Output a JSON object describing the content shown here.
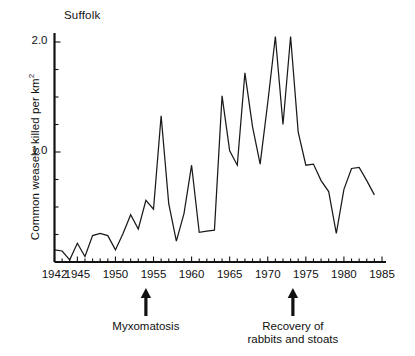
{
  "chart_data": {
    "type": "line",
    "title": "Suffolk",
    "xlabel": "",
    "ylabel": "Common weasels killed per km²",
    "xlim": [
      1942,
      1985
    ],
    "ylim": [
      0,
      2.18
    ],
    "grid": false,
    "legend": null,
    "x_major_ticks": [
      1942,
      1945,
      1950,
      1955,
      1960,
      1965,
      1970,
      1975,
      1980,
      1985
    ],
    "x_major_tick_labels": [
      "1942",
      "1945",
      "1950",
      "1955",
      "1960",
      "1965",
      "1970",
      "1975",
      "1980",
      "1985"
    ],
    "x_minor_tick_interval": 1,
    "y_major_ticks": [
      1.0,
      2.0
    ],
    "y_major_tick_labels": [
      "1.0",
      "2.0"
    ],
    "y_minor_tick_interval": 0.25,
    "series": [
      {
        "name": "Common weasels killed per km2",
        "x": [
          1942,
          1943,
          1944,
          1945,
          1946,
          1947,
          1948,
          1949,
          1950,
          1951,
          1952,
          1953,
          1954,
          1955,
          1956,
          1957,
          1958,
          1959,
          1960,
          1961,
          1962,
          1963,
          1964,
          1965,
          1966,
          1967,
          1968,
          1969,
          1970,
          1971,
          1972,
          1973,
          1974,
          1975,
          1976,
          1977,
          1978,
          1979,
          1980,
          1981,
          1982,
          1983,
          1984
        ],
        "values": [
          0.11,
          0.1,
          0.02,
          0.17,
          0.05,
          0.24,
          0.26,
          0.24,
          0.11,
          0.26,
          0.43,
          0.3,
          0.56,
          0.48,
          1.33,
          0.53,
          0.19,
          0.44,
          0.88,
          0.27,
          0.28,
          0.29,
          1.51,
          1.01,
          0.88,
          1.72,
          1.23,
          0.89,
          1.45,
          2.05,
          1.25,
          2.05,
          1.18,
          0.88,
          0.89,
          0.74,
          0.64,
          0.26,
          0.66,
          0.85,
          0.86,
          0.74,
          0.61
        ]
      }
    ],
    "annotations": [
      {
        "id": "myxomatosis",
        "label": "Myxomatosis",
        "x": 1954,
        "marker": "up-arrow",
        "position": "below-axis"
      },
      {
        "id": "recovery",
        "label": "Recovery of\nrabbits and stoats",
        "line1": "Recovery of",
        "line2": "rabbits and stoats",
        "x": 1973.3,
        "marker": "up-arrow",
        "position": "below-axis"
      }
    ]
  },
  "figure": {
    "background_color": "#ffffff",
    "line_color": "#1a1a1a",
    "axis_color": "#111111"
  },
  "axis": {
    "y_labels": [
      {
        "text": "2.0",
        "value": 2.0
      },
      {
        "text": "1.0",
        "value": 1.0
      }
    ],
    "x_labels": [
      {
        "text": "1942",
        "value": 1942
      },
      {
        "text": "1945",
        "value": 1945
      },
      {
        "text": "1950",
        "value": 1950
      },
      {
        "text": "1955",
        "value": 1955
      },
      {
        "text": "1960",
        "value": 1960
      },
      {
        "text": "1965",
        "value": 1965
      },
      {
        "text": "1970",
        "value": 1970
      },
      {
        "text": "1975",
        "value": 1975
      },
      {
        "text": "1980",
        "value": 1980
      },
      {
        "text": "1985",
        "value": 1985
      }
    ]
  },
  "labels": {
    "panel_title": "Suffolk",
    "y_axis_title_main": "Common weasels killed per km",
    "y_axis_title_exponent": "2",
    "annotation_myxomatosis": "Myxomatosis",
    "annotation_recovery_line1": "Recovery of",
    "annotation_recovery_line2": "rabbits and stoats"
  }
}
